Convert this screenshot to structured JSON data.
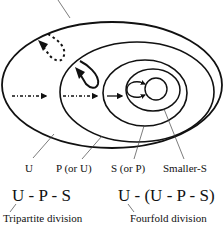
{
  "diagram": {
    "regions": [
      {
        "id": "U",
        "label": "U"
      },
      {
        "id": "P",
        "label": "P (or U)"
      },
      {
        "id": "S",
        "label": "S (or P)"
      },
      {
        "id": "smaller_s",
        "label": "Smaller-S"
      }
    ],
    "formulas": [
      {
        "expression": "U - P - S",
        "caption": "Tripartite division"
      },
      {
        "expression": "U - (U - P - S)",
        "caption": "Fourfold division"
      }
    ],
    "colors": {
      "stroke": "#111111",
      "background": "#ffffff",
      "leader_line": "#444444"
    }
  }
}
